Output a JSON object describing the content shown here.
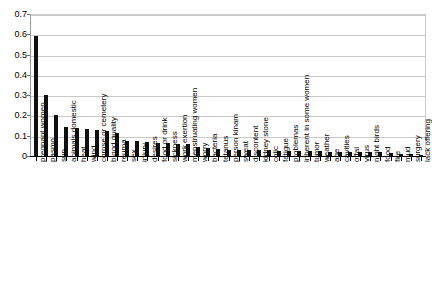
{
  "chart_data": {
    "type": "bar",
    "title": "",
    "subtitle": "",
    "xlabel": "",
    "ylabel": "",
    "ylim": [
      0,
      0.7
    ],
    "grid": true,
    "legend": false,
    "legend_position": "none",
    "bar_color": "#101010",
    "orientation": "vertical",
    "categories": [
      "pregnant women",
      "pasmo",
      "sun",
      "animals domestic",
      "heat",
      "wind",
      "corpse or cemetery",
      "blood quality",
      "reuma",
      "sex",
      "injury",
      "desires",
      "food or drink",
      "sickness",
      "work exertion",
      "menstruating women",
      "worry",
      "bacteria",
      "tetanus",
      "person kinam",
      "sweat",
      "discontent",
      "kidney stone",
      "colic",
      "fatigue",
      "problemas",
      "inherent in some women",
      "tumor",
      "weather",
      "age",
      "cavities",
      "offal",
      "virus",
      "night birds",
      "food",
      "fire",
      "mud",
      "surgery",
      "lack offering"
    ],
    "values": [
      0.59,
      0.3,
      0.2,
      0.145,
      0.138,
      0.135,
      0.128,
      0.125,
      0.112,
      0.075,
      0.072,
      0.068,
      0.066,
      0.064,
      0.06,
      0.058,
      0.042,
      0.038,
      0.034,
      0.032,
      0.03,
      0.03,
      0.028,
      0.028,
      0.026,
      0.026,
      0.026,
      0.024,
      0.024,
      0.022,
      0.022,
      0.02,
      0.02,
      0.02,
      0.018,
      0.014,
      0.012,
      0.008,
      0.006
    ],
    "ytick_labels": [
      "0",
      "0.1",
      "0.2",
      "0.3",
      "0.4",
      "0.5",
      "0.6",
      "0.7"
    ],
    "ytick_values": [
      0,
      0.1,
      0.2,
      0.3,
      0.4,
      0.5,
      0.6,
      0.7
    ]
  }
}
